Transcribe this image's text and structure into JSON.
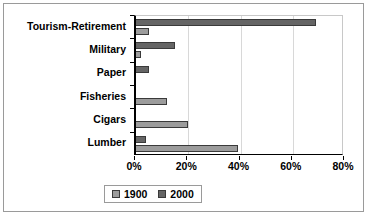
{
  "chart_data": {
    "type": "bar",
    "orientation": "horizontal",
    "title": "",
    "subtitle": "",
    "xlabel": "",
    "ylabel": "",
    "xlim": [
      0,
      80
    ],
    "xticks": [
      0,
      20,
      40,
      60,
      80
    ],
    "xtick_labels": [
      "0%",
      "20%",
      "40%",
      "60%",
      "80%"
    ],
    "grid": true,
    "grid_axis": "x",
    "legend_position": "bottom-center",
    "categories": [
      "Tourism-Retirement",
      "Military",
      "Paper",
      "Fisheries",
      "Cigars",
      "Lumber"
    ],
    "series": [
      {
        "name": "1900",
        "color": "#9c9c9c",
        "values": [
          5,
          2,
          0,
          12,
          20,
          39
        ]
      },
      {
        "name": "2000",
        "color": "#656565",
        "values": [
          69,
          15,
          5,
          0,
          0,
          4
        ]
      }
    ]
  },
  "legend": {
    "entries": [
      {
        "label": "1900",
        "swatch": "legend-swatch-1900"
      },
      {
        "label": "2000",
        "swatch": "legend-swatch-2000"
      }
    ]
  },
  "colors": {
    "series_1900": "#9c9c9c",
    "series_2000": "#656565",
    "axis": "#000000",
    "gridline": "#d8d8d8",
    "border": "#9a9a9a",
    "background": "#ffffff"
  }
}
